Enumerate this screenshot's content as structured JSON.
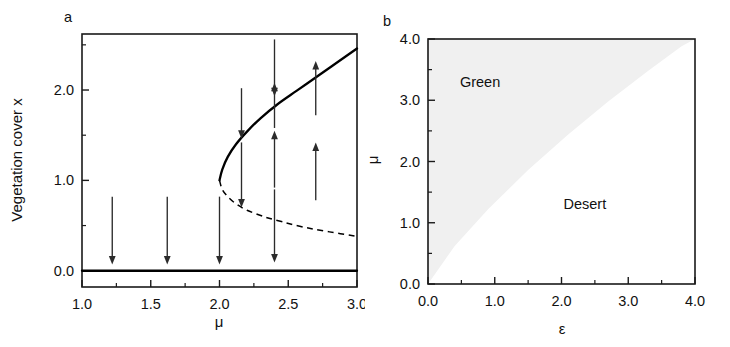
{
  "figure": {
    "width": 730,
    "height": 347,
    "background": "#ffffff",
    "line_color": "#000000",
    "shade_color": "#f0f0f0"
  },
  "panel_a": {
    "label": "a",
    "xlabel": "μ",
    "ylabel": "Vegetation cover x",
    "xlim": [
      1.0,
      3.0
    ],
    "ylim": [
      -0.18,
      2.62
    ],
    "xticks": [
      "1.0",
      "1.5",
      "2.0",
      "2.5",
      "3.0"
    ],
    "xtick_values": [
      1.0,
      1.5,
      2.0,
      2.5,
      3.0
    ],
    "xminor_values": [
      1.25,
      1.75,
      2.25,
      2.75
    ],
    "yticks": [
      "0.0",
      "1.0",
      "2.0"
    ],
    "ytick_values": [
      0.0,
      1.0,
      2.0
    ],
    "yminor_values": [
      0.5,
      1.5,
      2.5
    ],
    "branches": {
      "zero_stable": {
        "style": "solid",
        "label": "stable desert state x=0",
        "x_from": 1.0,
        "x_to": 3.0,
        "y": 0.0
      },
      "upper_stable": {
        "style": "solid",
        "label": "stable vegetated branch",
        "fold_mu": 2.0,
        "fold_x": 1.0,
        "points": [
          [
            2.0,
            1.0
          ],
          [
            2.02,
            1.12
          ],
          [
            2.06,
            1.26
          ],
          [
            2.12,
            1.4
          ],
          [
            2.2,
            1.54
          ],
          [
            2.3,
            1.69
          ],
          [
            2.42,
            1.84
          ],
          [
            2.56,
            1.99
          ],
          [
            2.72,
            2.16
          ],
          [
            2.86,
            2.31
          ],
          [
            3.0,
            2.46
          ]
        ]
      },
      "lower_unstable": {
        "style": "dashed",
        "label": "unstable branch",
        "points": [
          [
            2.0,
            1.0
          ],
          [
            2.02,
            0.9
          ],
          [
            2.06,
            0.82
          ],
          [
            2.12,
            0.74
          ],
          [
            2.2,
            0.67
          ],
          [
            2.32,
            0.6
          ],
          [
            2.46,
            0.54
          ],
          [
            2.62,
            0.48
          ],
          [
            2.8,
            0.43
          ],
          [
            3.0,
            0.38
          ]
        ]
      }
    },
    "arrows": [
      {
        "mu": 1.22,
        "y_start": 0.82,
        "y_end": 0.07,
        "dir": "down"
      },
      {
        "mu": 1.62,
        "y_start": 0.82,
        "y_end": 0.07,
        "dir": "down"
      },
      {
        "mu": 2.0,
        "y_start": 0.82,
        "y_end": 0.07,
        "dir": "down"
      },
      {
        "mu": 2.16,
        "y_start": 1.42,
        "y_end": 0.7,
        "dir": "up"
      },
      {
        "mu": 2.16,
        "y_start": 2.02,
        "y_end": 1.46,
        "dir": "down"
      },
      {
        "mu": 2.4,
        "y_start": 0.9,
        "y_end": 0.09,
        "dir": "down"
      },
      {
        "mu": 2.4,
        "y_start": 0.92,
        "y_end": 1.55,
        "dir": "up"
      },
      {
        "mu": 2.4,
        "y_start": 1.58,
        "y_end": 2.08,
        "dir": "up"
      },
      {
        "mu": 2.4,
        "y_start": 2.56,
        "y_end": 1.93,
        "dir": "down"
      },
      {
        "mu": 2.7,
        "y_start": 0.78,
        "y_end": 1.42,
        "dir": "up"
      },
      {
        "mu": 2.7,
        "y_start": 1.72,
        "y_end": 2.32,
        "dir": "up"
      }
    ]
  },
  "panel_b": {
    "label": "b",
    "xlabel": "ε",
    "ylabel": "μ",
    "xlim": [
      0.0,
      4.0
    ],
    "ylim": [
      0.0,
      4.0
    ],
    "xticks": [
      "0.0",
      "1.0",
      "2.0",
      "3.0",
      "4.0"
    ],
    "xtick_values": [
      0.0,
      1.0,
      2.0,
      3.0,
      4.0
    ],
    "xminor_values": [
      0.5,
      1.5,
      2.5,
      3.5
    ],
    "yticks": [
      "0.0",
      "1.0",
      "2.0",
      "3.0",
      "4.0"
    ],
    "ytick_values": [
      0.0,
      1.0,
      2.0,
      3.0,
      4.0
    ],
    "yminor_values": [
      0.5,
      1.5,
      2.5,
      3.5
    ],
    "regions": [
      {
        "name": "green",
        "label": "Green",
        "label_eps": 0.78,
        "label_mu": 3.22,
        "shaded": true
      },
      {
        "name": "desert",
        "label": "Desert",
        "label_eps": 2.35,
        "label_mu": 1.22,
        "shaded": false
      }
    ],
    "boundary": {
      "description": "bifurcation line separating Green (upper-left, shaded) from Desert (lower-right)",
      "points": [
        [
          0.0,
          0.0
        ],
        [
          0.4,
          0.62
        ],
        [
          0.9,
          1.22
        ],
        [
          1.5,
          1.86
        ],
        [
          2.1,
          2.44
        ],
        [
          2.7,
          2.98
        ],
        [
          3.3,
          3.48
        ],
        [
          3.8,
          3.88
        ],
        [
          4.0,
          4.0
        ]
      ]
    }
  }
}
